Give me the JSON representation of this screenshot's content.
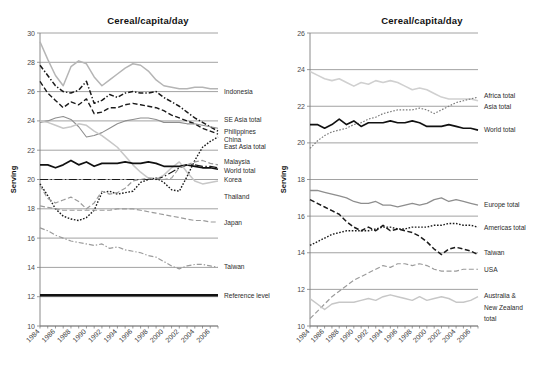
{
  "figure": {
    "width": 556,
    "height": 372,
    "background": "#ffffff"
  },
  "chart_data": [
    {
      "id": "left",
      "type": "line",
      "title": "Cereal/capita/day",
      "xlabel": "",
      "ylabel": "Serving",
      "xlim": [
        1984,
        2007
      ],
      "ylim": [
        10,
        30
      ],
      "ytick_step": 2,
      "yticks": [
        10,
        12,
        14,
        16,
        18,
        20,
        22,
        24,
        26,
        28,
        30
      ],
      "x": [
        1984,
        1985,
        1986,
        1987,
        1988,
        1989,
        1990,
        1991,
        1992,
        1993,
        1994,
        1995,
        1996,
        1997,
        1998,
        1999,
        2000,
        2001,
        2002,
        2003,
        2004,
        2005,
        2006,
        2007
      ],
      "xticks": [
        1984,
        1986,
        1988,
        1990,
        1992,
        1994,
        1996,
        1998,
        2000,
        2002,
        2004,
        2006
      ],
      "grid": true,
      "legend": "right-labels",
      "series": [
        {
          "name": "Indonesia",
          "color": "#1a1a1a",
          "style": "dashdot",
          "width": 1.5,
          "values": [
            27.8,
            27.1,
            26.4,
            26.0,
            25.9,
            26.1,
            26.7,
            25.2,
            25.4,
            25.8,
            25.6,
            25.9,
            26.0,
            25.9,
            25.9,
            26.0,
            25.6,
            25.3,
            25.0,
            24.6,
            24.2,
            23.9,
            23.6,
            23.3
          ]
        },
        {
          "name": "SE Asia total",
          "color": "#1a1a1a",
          "style": "dashed",
          "width": 1.4,
          "values": [
            26.7,
            25.9,
            25.4,
            24.9,
            25.3,
            25.1,
            25.5,
            24.5,
            24.6,
            24.9,
            24.9,
            25.1,
            25.2,
            25.1,
            25.0,
            24.9,
            24.7,
            24.4,
            24.2,
            24.0,
            23.8,
            23.5,
            23.3,
            23.1
          ]
        },
        {
          "name": "Philippines",
          "color": "#b5b5b5",
          "style": "solid",
          "width": 1.5,
          "values": [
            29.4,
            28.2,
            27.1,
            26.4,
            27.7,
            28.1,
            27.9,
            27.0,
            26.4,
            26.8,
            27.2,
            27.6,
            27.9,
            27.8,
            27.4,
            26.8,
            26.4,
            26.3,
            26.2,
            26.2,
            26.3,
            26.3,
            26.2,
            26.2
          ]
        },
        {
          "name": "China",
          "color": "#8e8e8e",
          "style": "solid",
          "width": 1.1,
          "values": [
            23.9,
            24.0,
            24.2,
            24.3,
            24.1,
            23.6,
            22.9,
            23.0,
            23.2,
            23.5,
            23.8,
            24.0,
            24.1,
            24.2,
            24.2,
            24.1,
            23.9,
            23.9,
            23.9,
            23.8,
            23.8,
            23.7,
            23.6,
            23.5
          ]
        },
        {
          "name": "East Asia total",
          "color": "#c7c7c7",
          "style": "solid",
          "width": 1.5,
          "values": [
            24.0,
            23.9,
            23.7,
            23.5,
            23.6,
            23.8,
            23.7,
            23.3,
            23.0,
            22.6,
            22.2,
            21.6,
            21.0,
            20.5,
            20.1,
            20.0,
            20.3,
            20.8,
            21.2,
            20.5,
            19.9,
            19.7,
            19.8,
            19.9
          ]
        },
        {
          "name": "Malaysia",
          "color": "#1a1a1a",
          "style": "dotted",
          "width": 1.4,
          "values": [
            19.7,
            18.9,
            18.0,
            17.5,
            17.3,
            17.2,
            17.4,
            17.9,
            19.1,
            19.2,
            19.0,
            19.1,
            19.2,
            19.8,
            20.0,
            20.1,
            19.8,
            19.3,
            19.2,
            20.2,
            21.3,
            22.2,
            22.6,
            22.9
          ]
        },
        {
          "name": "World total",
          "color": "#111111",
          "style": "solid",
          "width": 1.7,
          "values": [
            21.0,
            21.0,
            20.8,
            21.0,
            21.3,
            21.0,
            21.2,
            20.9,
            21.1,
            21.1,
            21.1,
            21.2,
            21.1,
            21.1,
            21.2,
            21.1,
            20.9,
            20.9,
            20.9,
            21.0,
            20.9,
            20.8,
            20.8,
            20.7
          ]
        },
        {
          "name": "Korea",
          "color": "#1a1a1a",
          "style": "longdashdot",
          "width": 1.2,
          "values": [
            20.0,
            20.0,
            20.0,
            20.0,
            20.0,
            20.0,
            20.0,
            20.0,
            20.0,
            20.0,
            20.0,
            20.0,
            20.0,
            20.0,
            20.0,
            20.0,
            20.2,
            20.5,
            20.8,
            21.0,
            21.0,
            20.9,
            20.9,
            20.8
          ]
        },
        {
          "name": "Thailand",
          "color": "#9b9b9b",
          "style": "dashed",
          "width": 1.2,
          "values": [
            19.6,
            18.7,
            18.4,
            18.6,
            18.8,
            18.5,
            18.0,
            18.4,
            19.2,
            19.0,
            19.1,
            19.4,
            19.9,
            20.0,
            20.1,
            20.1,
            20.0,
            20.1,
            20.8,
            21.0,
            21.2,
            21.3,
            21.1,
            21.0
          ]
        },
        {
          "name": "Japan",
          "color": "#9b9b9b",
          "style": "dashed",
          "width": 1.2,
          "values": [
            18.2,
            18.1,
            18.0,
            17.9,
            17.9,
            17.9,
            17.9,
            17.9,
            17.9,
            17.9,
            18.0,
            18.0,
            18.0,
            17.9,
            17.8,
            17.7,
            17.6,
            17.5,
            17.4,
            17.3,
            17.2,
            17.2,
            17.1,
            17.1
          ]
        },
        {
          "name": "Taiwan",
          "color": "#9b9b9b",
          "style": "dashdot",
          "width": 1.2,
          "values": [
            16.7,
            16.5,
            16.2,
            16.0,
            15.8,
            15.7,
            15.6,
            15.5,
            15.6,
            15.3,
            15.4,
            15.2,
            15.1,
            15.0,
            14.8,
            14.7,
            14.4,
            14.1,
            13.9,
            14.1,
            14.2,
            14.2,
            14.1,
            14.0
          ]
        },
        {
          "name": "Reference level",
          "color": "#111111",
          "style": "solid",
          "width": 2.6,
          "values": [
            12.1,
            12.1,
            12.1,
            12.1,
            12.1,
            12.1,
            12.1,
            12.1,
            12.1,
            12.1,
            12.1,
            12.1,
            12.1,
            12.1,
            12.1,
            12.1,
            12.1,
            12.1,
            12.1,
            12.1,
            12.1,
            12.1,
            12.1,
            12.1
          ]
        }
      ],
      "labels": [
        {
          "text": "Indonesia",
          "y": 26.0
        },
        {
          "text": "SE Asia total",
          "y": 24.05
        },
        {
          "text": "Philippines",
          "y": 23.25
        },
        {
          "text": "China",
          "y": 22.75
        },
        {
          "text": "East Asia total",
          "y": 22.25
        },
        {
          "text": "Malaysia",
          "y": 21.2
        },
        {
          "text": "World total",
          "y": 20.6
        },
        {
          "text": "Korea",
          "y": 20.0
        },
        {
          "text": "Thailand",
          "y": 18.85
        },
        {
          "text": "Japan",
          "y": 17.05
        },
        {
          "text": "Taiwan",
          "y": 14.05
        },
        {
          "text": "Reference level",
          "y": 12.1
        }
      ]
    },
    {
      "id": "right",
      "type": "line",
      "title": "Cereal/capita/day",
      "xlabel": "",
      "ylabel": "Serving",
      "xlim": [
        1984,
        2007
      ],
      "ylim": [
        10,
        26
      ],
      "ytick_step": 2,
      "yticks": [
        10,
        12,
        14,
        16,
        18,
        20,
        22,
        24,
        26
      ],
      "x": [
        1984,
        1985,
        1986,
        1987,
        1988,
        1989,
        1990,
        1991,
        1992,
        1993,
        1994,
        1995,
        1996,
        1997,
        1998,
        1999,
        2000,
        2001,
        2002,
        2003,
        2004,
        2005,
        2006,
        2007
      ],
      "xticks": [
        1984,
        1986,
        1988,
        1990,
        1992,
        1994,
        1996,
        1998,
        2000,
        2002,
        2004,
        2006
      ],
      "grid": true,
      "legend": "right-labels",
      "series": [
        {
          "name": "Africa total",
          "color": "#d0d0d0",
          "style": "solid",
          "width": 1.6,
          "values": [
            23.9,
            23.7,
            23.5,
            23.4,
            23.5,
            23.3,
            23.1,
            23.3,
            23.2,
            23.4,
            23.3,
            23.4,
            23.3,
            23.1,
            22.9,
            23.0,
            22.9,
            22.7,
            22.5,
            22.4,
            22.4,
            22.4,
            22.4,
            22.3
          ]
        },
        {
          "name": "Asia total",
          "color": "#7c7c7c",
          "style": "dotted",
          "width": 1.2,
          "values": [
            19.7,
            20.1,
            20.4,
            20.6,
            20.7,
            20.8,
            21.0,
            21.1,
            21.3,
            21.4,
            21.6,
            21.7,
            21.8,
            21.8,
            21.8,
            21.9,
            21.8,
            21.6,
            21.8,
            22.0,
            22.2,
            22.3,
            22.4,
            22.5
          ]
        },
        {
          "name": "World total",
          "color": "#111111",
          "style": "solid",
          "width": 1.7,
          "values": [
            21.0,
            21.0,
            20.8,
            21.0,
            21.3,
            21.0,
            21.2,
            20.9,
            21.1,
            21.1,
            21.1,
            21.2,
            21.1,
            21.1,
            21.2,
            21.1,
            20.9,
            20.9,
            20.9,
            21.0,
            20.9,
            20.8,
            20.8,
            20.7
          ]
        },
        {
          "name": "Europe total",
          "color": "#8e8e8e",
          "style": "solid",
          "width": 1.3,
          "values": [
            17.4,
            17.4,
            17.3,
            17.2,
            17.1,
            17.0,
            16.8,
            16.7,
            16.7,
            16.8,
            16.6,
            16.6,
            16.5,
            16.6,
            16.7,
            16.6,
            16.7,
            16.9,
            17.0,
            16.8,
            16.9,
            16.8,
            16.7,
            16.6
          ]
        },
        {
          "name": "Americas total",
          "color": "#1a1a1a",
          "style": "dotted",
          "width": 1.4,
          "values": [
            14.4,
            14.6,
            14.8,
            15.0,
            15.1,
            15.2,
            15.2,
            15.2,
            15.2,
            15.3,
            15.4,
            15.4,
            15.3,
            15.3,
            15.4,
            15.4,
            15.4,
            15.5,
            15.5,
            15.6,
            15.6,
            15.5,
            15.5,
            15.4
          ]
        },
        {
          "name": "Taiwan",
          "color": "#1a1a1a",
          "style": "dashed",
          "width": 1.5,
          "values": [
            16.9,
            16.7,
            16.5,
            16.3,
            16.1,
            15.7,
            15.4,
            15.2,
            15.4,
            15.2,
            15.5,
            15.2,
            15.3,
            15.2,
            15.1,
            14.9,
            14.6,
            14.2,
            13.9,
            14.2,
            14.3,
            14.2,
            14.1,
            13.9
          ]
        },
        {
          "name": "USA",
          "color": "#9b9b9b",
          "style": "dashed",
          "width": 1.2,
          "values": [
            10.4,
            10.8,
            11.2,
            11.6,
            11.9,
            12.2,
            12.5,
            12.7,
            12.9,
            13.1,
            13.3,
            13.2,
            13.4,
            13.4,
            13.3,
            13.4,
            13.3,
            13.1,
            13.0,
            13.0,
            13.0,
            13.1,
            13.1,
            13.1
          ]
        },
        {
          "name": "Australia & New Zealand total",
          "color": "#c7c7c7",
          "style": "solid",
          "width": 1.5,
          "values": [
            11.5,
            11.2,
            10.9,
            11.2,
            11.3,
            11.3,
            11.3,
            11.4,
            11.5,
            11.4,
            11.6,
            11.7,
            11.6,
            11.5,
            11.4,
            11.6,
            11.4,
            11.5,
            11.6,
            11.5,
            11.3,
            11.3,
            11.4,
            11.6
          ]
        }
      ],
      "labels": [
        {
          "text": "Africa total",
          "y": 22.55
        },
        {
          "text": "Asia total",
          "y": 22.0
        },
        {
          "text": "World total",
          "y": 20.7
        },
        {
          "text": "Europe total",
          "y": 16.65
        },
        {
          "text": "Americas total",
          "y": 15.35
        },
        {
          "text": "Taiwan",
          "y": 14.0
        },
        {
          "text": "USA",
          "y": 13.1
        },
        {
          "text": "Australia &",
          "y": 11.65
        },
        {
          "text": "New Zealand",
          "y": 11.0
        },
        {
          "text": "total",
          "y": 10.4
        }
      ]
    }
  ]
}
